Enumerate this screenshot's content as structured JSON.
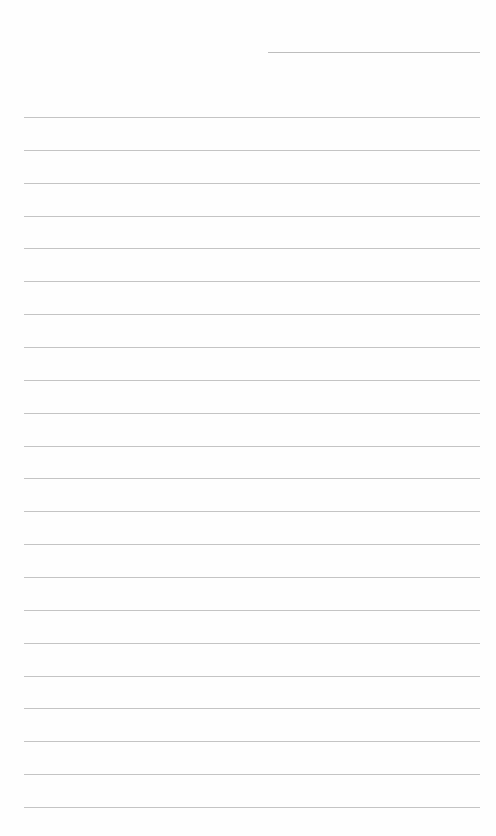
{
  "page": {
    "type": "lined-writing-sheet",
    "line_color": "#c4c4c4",
    "background": "#fefefe",
    "date_line": {
      "value": ""
    },
    "lines": [
      "",
      "",
      "",
      "",
      "",
      "",
      "",
      "",
      "",
      "",
      "",
      "",
      "",
      "",
      "",
      "",
      "",
      "",
      "",
      "",
      "",
      ""
    ]
  }
}
